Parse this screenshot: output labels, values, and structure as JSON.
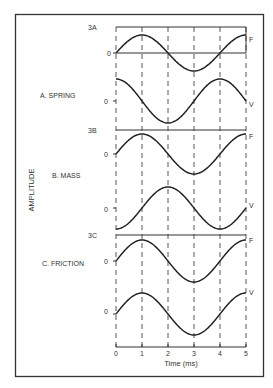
{
  "figure": {
    "y_axis_label": "AMPLITUDE",
    "x_axis_label": "Time (ms)",
    "x_ticks": [
      "0",
      "1",
      "2",
      "3",
      "4",
      "5"
    ],
    "colors": {
      "line": "#222222",
      "frame": "#333333",
      "text": "#333333",
      "dash": "#444444"
    }
  },
  "panels": [
    {
      "id": "3A",
      "tag": "3A",
      "title": "A. SPRING",
      "traces": [
        {
          "label": "F",
          "zero_label": "0",
          "description": "Force leads; peak at 1 ms, trough at 3 ms"
        },
        {
          "label": "V",
          "zero_label": "0",
          "description": "Velocity; trough at 2 ms, peak at 4 ms"
        }
      ]
    },
    {
      "id": "3B",
      "tag": "3B",
      "title": "B. MASS",
      "traces": [
        {
          "label": "F",
          "zero_label": "0",
          "description": "Force; peak at 1 ms, trough at 3 ms"
        },
        {
          "label": "V",
          "zero_label": "0",
          "description": "Velocity lags; peak at 2 ms, trough at 4 ms"
        }
      ]
    },
    {
      "id": "3C",
      "tag": "3C",
      "title": "C. FRICTION",
      "traces": [
        {
          "label": "F",
          "zero_label": "0",
          "description": "Force; peak at 1 ms, trough at 3 ms"
        },
        {
          "label": "V",
          "zero_label": "0",
          "description": "Velocity in phase; peak at 1 ms, trough at 3 ms"
        }
      ]
    }
  ],
  "chart_data": {
    "type": "line",
    "title": "",
    "xlabel": "Time (ms)",
    "ylabel": "AMPLITUDE",
    "x_range": [
      0,
      5
    ],
    "period_ms": 4,
    "panels": [
      {
        "name": "A. SPRING",
        "series": [
          {
            "name": "F",
            "phase_deg": 0,
            "peak_ms": 1,
            "trough_ms": 3
          },
          {
            "name": "V",
            "phase_deg": 90,
            "peak_ms": 4,
            "trough_ms": 2
          }
        ]
      },
      {
        "name": "B. MASS",
        "series": [
          {
            "name": "F",
            "phase_deg": 0,
            "peak_ms": 1,
            "trough_ms": 3
          },
          {
            "name": "V",
            "phase_deg": -90,
            "peak_ms": 2,
            "trough_ms": 4
          }
        ]
      },
      {
        "name": "C. FRICTION",
        "series": [
          {
            "name": "F",
            "phase_deg": 0,
            "peak_ms": 1,
            "trough_ms": 3
          },
          {
            "name": "V",
            "phase_deg": 0,
            "peak_ms": 1,
            "trough_ms": 3
          }
        ]
      }
    ],
    "grid": "vertical dashed at each ms"
  }
}
